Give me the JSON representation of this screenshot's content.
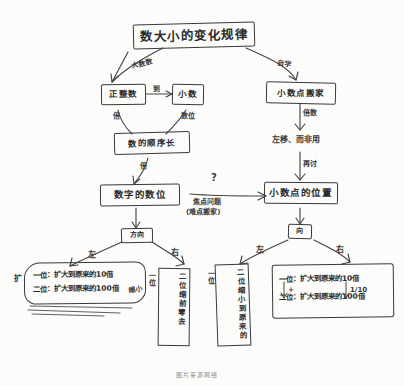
{
  "document": {
    "kind": "hand-drawn-mindmap",
    "language": "zh",
    "ink_color": "#3a3a3a",
    "paper_color": "#fcfcfa",
    "caption": "图片来源网络"
  },
  "root": {
    "label": "数大小的变化规律"
  },
  "branch_labels": {
    "left_from_root": "大数数",
    "right_from_root": "自学",
    "left_chain_1": "倍",
    "left_chain_2": "数位",
    "right_chain_1": "倍数",
    "right_chain_2": "再讨",
    "to_question": "到"
  },
  "nodes": {
    "big_number": "正整数",
    "small_number": "小数",
    "arrow_mid_label": "到",
    "order_box": "数的顺序长",
    "digit_value": "数字的数位",
    "decimal_move": "小数点搬家",
    "left_right": "左移、而非用",
    "decimal_position": "小数点的位置",
    "direction_left": "方向",
    "direction_right": "向"
  },
  "middle_annotation": {
    "question_mark": "?",
    "line1": "焦点问题",
    "line2": "(难点搬家)"
  },
  "direction_marks": {
    "left": "左",
    "right": "右"
  },
  "leaf_left_note": {
    "prefix": "扩",
    "line1": "一位：扩大到原来的10倍",
    "line2": "二位：扩大到原来的100倍",
    "side_note": "缩小"
  },
  "leaf_middle_1": {
    "head": "二位",
    "body": "缩前零去",
    "tail": "一位",
    "extra": "能力零去的"
  },
  "leaf_middle_2": {
    "head": "二位",
    "body": "缩小到原来的",
    "tail": "一位",
    "extra": "自零去到原来的1/10"
  },
  "leaf_right_note": {
    "line1": "一位：扩大到原来的10倍",
    "line2": "二位：扩大到原来的100倍",
    "mark_left": "+",
    "mark_right": "1/10"
  }
}
